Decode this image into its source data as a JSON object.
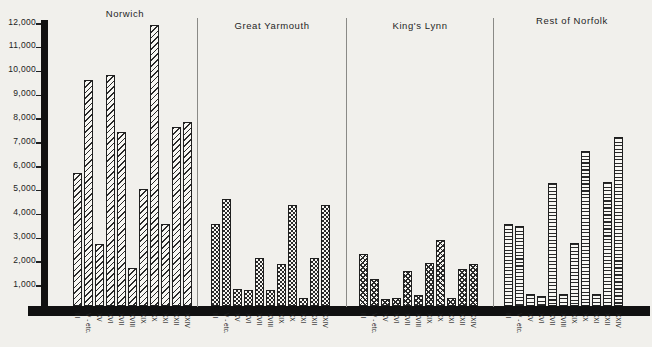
{
  "colors": {
    "ink": "#1f1f1f",
    "paper": "#f1f0ec"
  },
  "chart_data": {
    "type": "bar",
    "title": "",
    "xlabel": "",
    "ylabel": "",
    "ylim": [
      0,
      12000
    ],
    "grid": false,
    "legend": false,
    "y_tick_labels": [
      "12,000",
      "11,000",
      "10,000",
      "9,000",
      "8,000",
      "7,000",
      "6,000",
      "5,000",
      "4,000",
      "3,000",
      "2,000",
      "1,000"
    ],
    "y_tick_values": [
      12000,
      11000,
      10000,
      9000,
      8000,
      7000,
      6000,
      5000,
      4000,
      3000,
      2000,
      1000
    ],
    "categories": [
      "III",
      "V - etc.",
      "XV",
      "XVI",
      "XVII",
      "XVIII",
      "XIX",
      "XX",
      "XXI",
      "XXII",
      "XXIV"
    ],
    "series": [
      {
        "name": "Norwich",
        "pattern": "diagonal-hatch",
        "values": [
          5600,
          9500,
          2600,
          9700,
          7300,
          1600,
          4900,
          11800,
          3450,
          7500,
          7700
        ]
      },
      {
        "name": "Great Yarmouth",
        "pattern": "checkerboard",
        "values": [
          3450,
          4500,
          700,
          680,
          2000,
          690,
          1750,
          4250,
          350,
          2000,
          4250
        ]
      },
      {
        "name": "King's Lynn",
        "pattern": "crosshatch",
        "values": [
          2200,
          1150,
          300,
          350,
          1450,
          450,
          1800,
          2750,
          350,
          1550,
          1750
        ]
      },
      {
        "name": "Rest of Norfolk",
        "pattern": "horizontal-hatch",
        "values": [
          3450,
          3350,
          500,
          400,
          5150,
          500,
          2650,
          6500,
          500,
          5200,
          7100
        ]
      }
    ]
  }
}
